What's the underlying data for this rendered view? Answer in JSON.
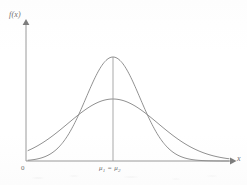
{
  "figure": {
    "caption_hidden": "Two normal probability density curves with equal means and unequal standard deviations",
    "axis": {
      "y_label": "f(x)",
      "x_label": "x",
      "origin_label": "0"
    },
    "annotations": {
      "mean_marker_label": "μ",
      "mean_sub_1": "1",
      "mean_equals": " = ",
      "mean_sub_2": "2"
    },
    "colors": {
      "curve": "#8a8a8a",
      "axis": "#8f8f8f",
      "text": "#6f6f6f",
      "background": "#fefefe"
    }
  },
  "chart_data": {
    "type": "line",
    "title": "",
    "subtitle": "",
    "xlabel": "x",
    "ylabel": "f(x)",
    "grid": false,
    "legend": "none",
    "xlim": [
      0,
      247
    ],
    "ylim": [
      0,
      1
    ],
    "annotations": [
      {
        "text": "μ₁ = μ₂",
        "x": 113,
        "y": 0,
        "role": "common-mean-tick"
      },
      {
        "text": "0",
        "x": 26,
        "y": 0,
        "role": "origin"
      }
    ],
    "axes_geometry": {
      "x_axis_y_px": 161,
      "y_axis_x_px": 26,
      "x_axis_end_px": 232,
      "y_axis_top_px": 22,
      "center_x_px": 113
    },
    "series": [
      {
        "name": "narrow curve (small sigma)",
        "distribution": "normal",
        "mean_px": 113,
        "sigma_px": 27,
        "peak_y_px": 57,
        "peak_height_px": 104,
        "baseline_y_px": 161,
        "relative_peak": 1.0,
        "relative_sigma": 1.0
      },
      {
        "name": "wide curve (large sigma)",
        "distribution": "normal",
        "mean_px": 113,
        "sigma_px": 45,
        "peak_y_px": 99,
        "peak_height_px": 62,
        "baseline_y_px": 161,
        "relative_peak": 0.6,
        "relative_sigma": 1.667
      }
    ],
    "intersections": [
      {
        "x_px": 63,
        "y_px": 137
      },
      {
        "x_px": 163,
        "y_px": 137
      }
    ],
    "center_line": {
      "x_px": 113,
      "from_y_px": 57,
      "to_y_px": 161
    }
  }
}
